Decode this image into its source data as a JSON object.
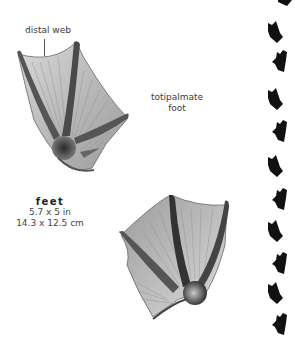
{
  "annotations": {
    "distal_web": "distal web",
    "foot_type_line1": "totipalmate",
    "foot_type_line2": "foot"
  },
  "size": {
    "title": "feet",
    "imperial": "5.7 x 5 in",
    "metric": "14.3 x 12.5 cm"
  },
  "illustrations": [
    {
      "name": "upper-foot",
      "description": "webbed foot, toes pointing up-left"
    },
    {
      "name": "lower-foot",
      "description": "webbed foot, toes pointing up-right"
    }
  ],
  "track_pattern": {
    "color": "#111111",
    "count": 11
  }
}
